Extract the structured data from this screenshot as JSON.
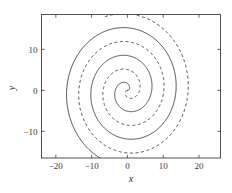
{
  "figure": {
    "panel_label": "",
    "background_color": "#ffffff",
    "line_color": "#2a2a2a",
    "frame_color": "#3f3f3f"
  },
  "chart_data": {
    "type": "line",
    "title": "",
    "subtitle": "",
    "xlabel": "x",
    "ylabel": "y",
    "xlim": [
      -24.0,
      26.0
    ],
    "ylim": [
      -16.5,
      18.5
    ],
    "xticks": [
      -20,
      -10,
      0,
      10,
      20
    ],
    "xticklabels": [
      "−20",
      "−10",
      "0",
      "10",
      "20"
    ],
    "yticks": [
      10,
      0,
      -10
    ],
    "yticklabels": [
      "10",
      "0",
      "−10"
    ],
    "grid": false,
    "legend": null,
    "legend_position": "none",
    "annotations": [],
    "series": [
      {
        "name": "spiral-solid",
        "linestyle": "solid",
        "color": "#2a2a2a",
        "spiral": {
          "kind": "archimedean",
          "r_per_radian": 1.08,
          "phase_deg": 0,
          "theta_start_deg": 0,
          "theta_end_deg": 1010,
          "center": [
            0,
            0
          ],
          "direction": "counterclockwise"
        },
        "sample_points": [
          [
            0,
            0
          ],
          [
            1.2,
            1.1
          ],
          [
            0.1,
            2.4
          ],
          [
            -2.1,
            1.9
          ],
          [
            -3.2,
            -1.1
          ],
          [
            -1.4,
            -3.8
          ],
          [
            1.9,
            -4.0
          ],
          [
            4.6,
            -1.6
          ],
          [
            5.0,
            2.1
          ],
          [
            3.0,
            5.6
          ],
          [
            -0.9,
            7.2
          ],
          [
            -5.0,
            6.2
          ],
          [
            -7.9,
            2.8
          ],
          [
            -8.4,
            -1.5
          ],
          [
            -6.9,
            -5.9
          ],
          [
            -3.2,
            -9.2
          ],
          [
            1.6,
            -10.2
          ],
          [
            6.3,
            -8.7
          ],
          [
            9.9,
            -5.1
          ],
          [
            11.5,
            -0.3
          ],
          [
            10.9,
            5.1
          ],
          [
            8.1,
            9.9
          ],
          [
            3.6,
            13.2
          ],
          [
            -1.9,
            14.6
          ],
          [
            -7.5,
            13.7
          ],
          [
            -12.2,
            10.6
          ],
          [
            -15.4,
            5.7
          ],
          [
            -16.6,
            -0.3
          ],
          [
            -15.7,
            -6.6
          ],
          [
            -12.7,
            -12.3
          ],
          [
            -8.0,
            -16.3
          ]
        ]
      },
      {
        "name": "spiral-dashed",
        "linestyle": "dashed",
        "color": "#2a2a2a",
        "dash_pattern": [
          3,
          2.6
        ],
        "spiral": {
          "kind": "archimedean",
          "r_per_radian": 1.08,
          "phase_deg": 180,
          "theta_start_deg": 0,
          "theta_end_deg": 1010,
          "center": [
            0,
            0
          ],
          "direction": "counterclockwise"
        },
        "sample_points": [
          [
            0,
            0
          ],
          [
            -1.2,
            -1.1
          ],
          [
            -0.1,
            -2.4
          ],
          [
            2.1,
            -1.9
          ],
          [
            3.2,
            1.1
          ],
          [
            1.4,
            3.8
          ],
          [
            -1.9,
            4.0
          ],
          [
            -4.6,
            1.6
          ],
          [
            -5.0,
            -2.1
          ],
          [
            -3.0,
            -5.6
          ],
          [
            0.9,
            -7.2
          ],
          [
            5.0,
            -6.2
          ],
          [
            7.9,
            -2.8
          ],
          [
            8.4,
            1.5
          ],
          [
            6.9,
            5.9
          ],
          [
            3.2,
            9.2
          ],
          [
            -1.6,
            10.2
          ],
          [
            -6.3,
            8.7
          ],
          [
            -9.9,
            5.1
          ],
          [
            -11.5,
            0.3
          ],
          [
            -10.9,
            -5.1
          ],
          [
            -8.1,
            -9.9
          ],
          [
            -3.6,
            -13.2
          ],
          [
            1.9,
            -14.6
          ],
          [
            7.5,
            -13.7
          ],
          [
            12.2,
            -10.6
          ],
          [
            15.4,
            -5.7
          ],
          [
            16.6,
            0.3
          ],
          [
            15.7,
            6.6
          ],
          [
            12.7,
            12.3
          ],
          [
            8.0,
            16.3
          ],
          [
            2.2,
            18.4
          ]
        ]
      }
    ]
  }
}
